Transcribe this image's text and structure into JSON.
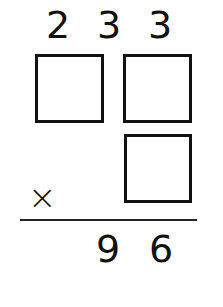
{
  "problem": {
    "type": "multiplication-puzzle",
    "top_digits": [
      "2",
      "3",
      "3"
    ],
    "operator": "×",
    "result_digits": [
      "9",
      "6"
    ],
    "blank_boxes": 3
  }
}
